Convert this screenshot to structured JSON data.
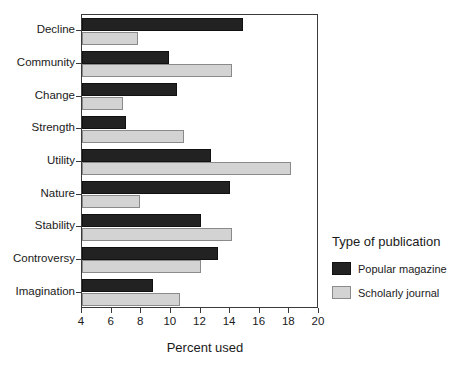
{
  "chart_data": {
    "type": "bar",
    "orientation": "horizontal",
    "title": "",
    "xlabel": "Percent used",
    "ylabel": "",
    "xlim": [
      4,
      20
    ],
    "xticks": [
      4,
      6,
      8,
      10,
      12,
      14,
      16,
      18,
      20
    ],
    "grid": false,
    "legend_title": "Type of publication",
    "legend_position": "right",
    "categories": [
      "Decline",
      "Community",
      "Change",
      "Strength",
      "Utility",
      "Nature",
      "Stability",
      "Controversy",
      "Imagination"
    ],
    "series": [
      {
        "name": "Popular magazine",
        "color": "#222222",
        "values": [
          14.9,
          9.9,
          10.4,
          7.0,
          12.7,
          14.0,
          12.0,
          13.2,
          8.8
        ]
      },
      {
        "name": "Scholarly journal",
        "color": "#d3d3d3",
        "values": [
          7.8,
          14.1,
          6.8,
          10.9,
          18.1,
          7.9,
          14.1,
          12.0,
          10.6
        ]
      }
    ]
  }
}
